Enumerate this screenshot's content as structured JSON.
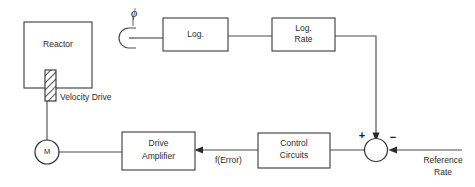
{
  "diagram": {
    "background_color": "#ffffff",
    "line_color": "#4a4a4a",
    "text_color": "#2b2b2b"
  },
  "blocks": {
    "reactor": {
      "label": "Reactor"
    },
    "log": {
      "label": "Log."
    },
    "log_rate": {
      "label_line1": "Log.",
      "label_line2": "Rate"
    },
    "control_circuits": {
      "label_line1": "Control",
      "label_line2": "Circuits"
    },
    "drive_amplifier": {
      "label_line1": "Drive",
      "label_line2": "Amplifier"
    },
    "motor": {
      "label": "M"
    }
  },
  "symbols": {
    "flux_detector": {
      "label": "ϕ",
      "name": "flux-detector"
    },
    "control_rod": {
      "label": "Velocity Drive",
      "name": "control-rod"
    },
    "summing_junction": {
      "name": "summing-junction",
      "plus_sign": "+",
      "minus_sign": "−"
    }
  },
  "signals": {
    "error": {
      "label": "f(Error)"
    },
    "reference_rate": {
      "label_line1": "Reference",
      "label_line2": "Rate"
    }
  }
}
